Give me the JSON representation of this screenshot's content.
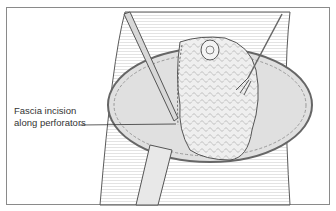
{
  "figure": {
    "annotation": {
      "line1": "Fascia incision",
      "line2": "along perforators"
    },
    "colors": {
      "outline": "#5a5a5a",
      "skin": "#e4e4e4",
      "flap": "#f0f0f0",
      "frame": "#8a8a8a"
    }
  }
}
